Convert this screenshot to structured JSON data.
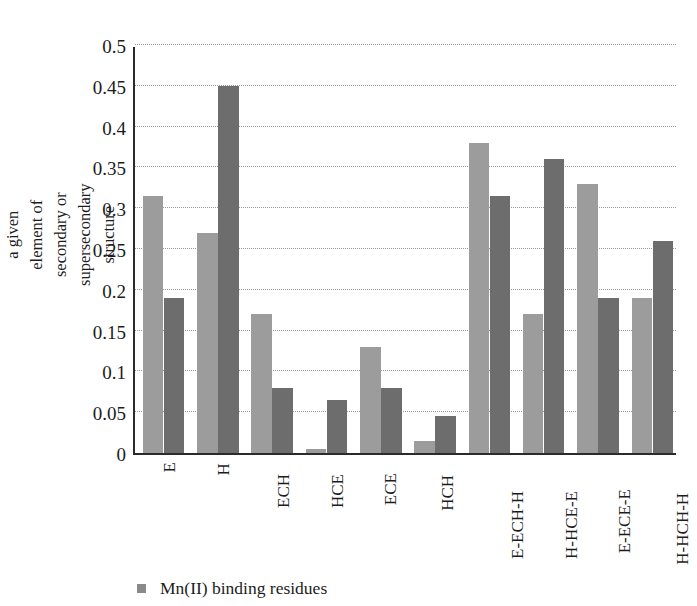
{
  "chart_data": {
    "type": "bar",
    "title": "",
    "subtitle": "",
    "xlabel": "",
    "ylabel": "The usage of amino acids in a given element of secondary or supersecondary structure",
    "ylim": [
      0,
      0.5
    ],
    "ytick_labels": [
      "0",
      "0.05",
      "0.1",
      "0.15",
      "0.2",
      "0.25",
      "0.3",
      "0.35",
      "0.4",
      "0.45",
      "0.5"
    ],
    "ytick_values": [
      0,
      0.05,
      0.1,
      0.15,
      0.2,
      0.25,
      0.3,
      0.35,
      0.4,
      0.45,
      0.5
    ],
    "grid": true,
    "grid_style": "dotted-horizontal",
    "legend_position": "bottom-left",
    "categories": [
      "E",
      "H",
      "ECH",
      "HCE",
      "ECE",
      "HCH",
      "E-ECH-H",
      "H-HCE-E",
      "E-ECE-E",
      "H-HCH-H"
    ],
    "series": [
      {
        "name": "Mn(II) binding residues",
        "color": "#9c9c9c",
        "values": [
          0.315,
          0.27,
          0.17,
          0.005,
          0.13,
          0.015,
          0.38,
          0.17,
          0.33,
          0.19
        ]
      },
      {
        "name": "",
        "color": "#6d6d6d",
        "values": [
          0.19,
          0.45,
          0.08,
          0.065,
          0.08,
          0.045,
          0.315,
          0.36,
          0.19,
          0.26
        ]
      }
    ]
  },
  "legend": {
    "items": [
      {
        "label": "Mn(II) binding residues",
        "marker": "square-marker",
        "color": "#8a8a8a"
      }
    ]
  },
  "axis": {
    "y_title": "The usage of amino acids in a given element of secondary or supersecondary structure"
  }
}
